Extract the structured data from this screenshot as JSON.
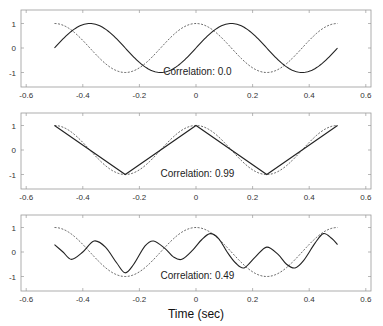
{
  "chart_data": [
    {
      "type": "line",
      "title": "",
      "annotation": "Correlation: 0.0",
      "xlim": [
        -0.62,
        0.62
      ],
      "ylim": [
        -1.6,
        1.6
      ],
      "xticks": [
        "-0.6",
        "-0.4",
        "-0.2",
        "0",
        "0.2",
        "0.4",
        "0.6"
      ],
      "yticks": [
        "1",
        "0",
        "-1"
      ],
      "series": [
        {
          "name": "reference (dashed)",
          "style": "dashed",
          "formula": "cos(4*pi*t)",
          "x_range": [
            -0.5,
            0.5
          ]
        },
        {
          "name": "signal (solid)",
          "style": "solid",
          "formula": "sin(4*pi*t)",
          "x_range": [
            -0.5,
            0.5
          ]
        }
      ]
    },
    {
      "type": "line",
      "title": "",
      "annotation": "Correlation: 0.99",
      "xlim": [
        -0.62,
        0.62
      ],
      "ylim": [
        -1.6,
        1.6
      ],
      "xticks": [
        "-0.6",
        "-0.4",
        "-0.2",
        "0",
        "0.2",
        "0.4",
        "0.6"
      ],
      "yticks": [
        "1",
        "0",
        "-1"
      ],
      "series": [
        {
          "name": "reference (dashed)",
          "style": "dashed",
          "formula": "cos(4*pi*t)",
          "x_range": [
            -0.5,
            0.5
          ]
        },
        {
          "name": "signal (solid)",
          "style": "solid",
          "formula": "triangle wave",
          "x": [
            -0.5,
            -0.25,
            0,
            0.25,
            0.5
          ],
          "y": [
            1,
            -1,
            1,
            -1,
            1
          ]
        }
      ]
    },
    {
      "type": "line",
      "title": "",
      "annotation": "Correlation: 0.49",
      "xlim": [
        -0.62,
        0.62
      ],
      "ylim": [
        -1.6,
        1.6
      ],
      "xticks": [
        "-0.6",
        "-0.4",
        "-0.2",
        "0",
        "0.2",
        "0.4",
        "0.6"
      ],
      "yticks": [
        "1",
        "0",
        "-1"
      ],
      "xlabel": "Time (sec)",
      "series": [
        {
          "name": "reference (dashed)",
          "style": "dashed",
          "formula": "cos(4*pi*t)",
          "x_range": [
            -0.5,
            0.5
          ]
        },
        {
          "name": "signal (solid)",
          "style": "solid",
          "x": [
            -0.5,
            -0.47,
            -0.44,
            -0.4,
            -0.36,
            -0.32,
            -0.28,
            -0.25,
            -0.22,
            -0.18,
            -0.15,
            -0.11,
            -0.08,
            -0.05,
            -0.01,
            0.02,
            0.05,
            0.08,
            0.11,
            0.14,
            0.17,
            0.21,
            0.25,
            0.29,
            0.32,
            0.35,
            0.38,
            0.42,
            0.45,
            0.48,
            0.5
          ],
          "y": [
            0.3,
            0.0,
            -0.3,
            0.0,
            0.45,
            0.2,
            -0.45,
            -0.85,
            -0.5,
            0.25,
            0.45,
            0.15,
            -0.2,
            -0.3,
            0.1,
            0.5,
            0.75,
            0.55,
            0.0,
            -0.45,
            -0.65,
            -0.2,
            0.2,
            -0.1,
            -0.5,
            -0.65,
            -0.35,
            0.35,
            0.75,
            0.55,
            0.3
          ]
        }
      ]
    }
  ],
  "panels": [
    {
      "annotation": "Correlation: 0.0"
    },
    {
      "annotation": "Correlation: 0.99"
    },
    {
      "annotation": "Correlation: 0.49"
    }
  ],
  "xlabel": "Time (sec)"
}
